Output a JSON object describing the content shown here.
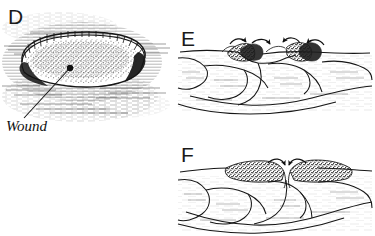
{
  "figure": {
    "style": "pen-and-ink line drawing",
    "background_color": "#ffffff",
    "ink_color": "#171717",
    "width": 375,
    "height": 236
  },
  "panels": [
    {
      "id": "panel-d",
      "letter": "D",
      "letter_x": 8,
      "letter_y": 24,
      "view": "surface view of open wound",
      "callout": {
        "label": "Wound",
        "label_x": 6,
        "label_y": 131,
        "leader_from_x": 24,
        "leader_from_y": 118,
        "leader_to_x": 70,
        "leader_to_y": 68,
        "dot_x": 70,
        "dot_y": 68,
        "dot_r": 3.2
      }
    },
    {
      "id": "panel-e",
      "letter": "E",
      "letter_x": 181,
      "letter_y": 46,
      "view": "cross-section, epithelial cells migrating toward wound centre",
      "arrows": 4
    },
    {
      "id": "panel-f",
      "letter": "F",
      "letter_x": 181,
      "letter_y": 162,
      "view": "cross-section, epithelial sheets meeting at wound centre",
      "arrows": 2
    }
  ]
}
